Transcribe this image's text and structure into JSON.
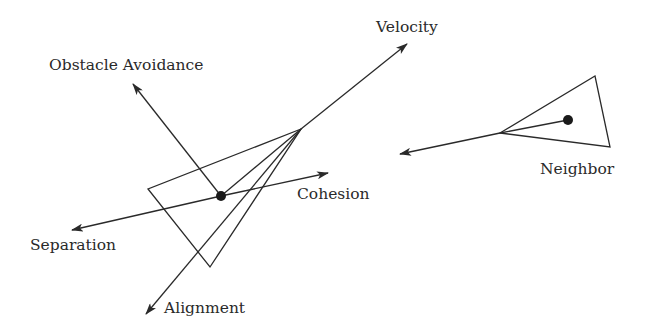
{
  "labels": {
    "velocity": "Velocity",
    "obstacle_avoidance": "Obstacle Avoidance",
    "cohesion": "Cohesion",
    "separation": "Separation",
    "alignment": "Alignment",
    "neighbor": "Neighbor"
  },
  "colors": {
    "stroke": "#2a2a2a",
    "background": "#ffffff"
  }
}
